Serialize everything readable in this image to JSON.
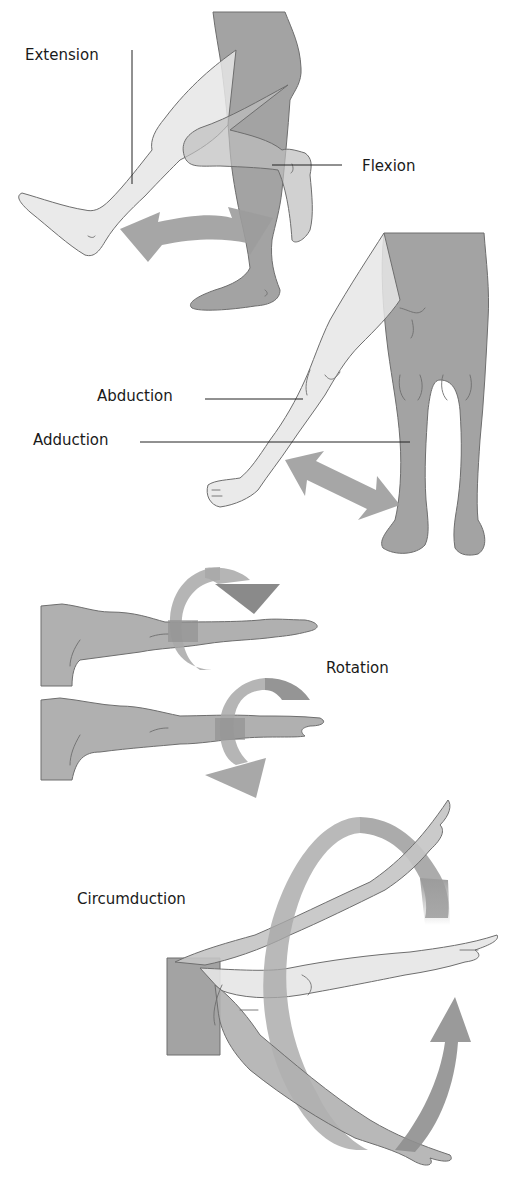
{
  "diagram": {
    "colors": {
      "background": "#ffffff",
      "limb_dark": "#a3a3a3",
      "limb_light": "#e6e6e6",
      "limb_mid": "#bdbdbd",
      "arrow": "#9c9c9c",
      "arrow_dark": "#8a8a8a",
      "outline": "#6e6e6e",
      "text": "#1a1a1a"
    },
    "panels": [
      {
        "id": "flexion-extension",
        "labels": [
          {
            "text": "Extension",
            "x": 25,
            "y": 60
          },
          {
            "text": "Flexion",
            "x": 362,
            "y": 171
          }
        ]
      },
      {
        "id": "abduction-adduction",
        "labels": [
          {
            "text": "Abduction",
            "x": 97,
            "y": 401
          },
          {
            "text": "Adduction",
            "x": 33,
            "y": 445
          }
        ]
      },
      {
        "id": "rotation",
        "labels": [
          {
            "text": "Rotation",
            "x": 326,
            "y": 673
          }
        ]
      },
      {
        "id": "circumduction",
        "labels": [
          {
            "text": "Circumduction",
            "x": 77,
            "y": 904
          }
        ]
      }
    ]
  }
}
